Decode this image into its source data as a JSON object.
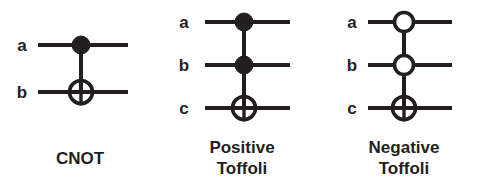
{
  "figure": {
    "background_color": "#ffffff",
    "ink_color": "#231f20",
    "width": 484,
    "height": 189
  },
  "gates": [
    {
      "id": "cnot",
      "caption_lines": [
        "CNOT"
      ],
      "caption": "CNOT",
      "wire_labels": [
        "a",
        "b"
      ],
      "control_type": "filled",
      "controls": 1,
      "targets": 1
    },
    {
      "id": "positive-toffoli",
      "caption_lines": [
        "Positive",
        "Toffoli"
      ],
      "caption": "Positive Toffoli",
      "wire_labels": [
        "a",
        "b",
        "c"
      ],
      "control_type": "filled",
      "controls": 2,
      "targets": 1
    },
    {
      "id": "negative-toffoli",
      "caption_lines": [
        "Negative",
        "Toffoli"
      ],
      "caption": "Negative Toffoli",
      "wire_labels": [
        "a",
        "b",
        "c"
      ],
      "control_type": "open",
      "controls": 2,
      "targets": 1
    }
  ]
}
